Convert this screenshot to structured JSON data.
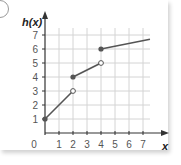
{
  "chart_data": {
    "type": "line",
    "title": "",
    "ylabel": "h(x)",
    "xlabel": "x",
    "origin_label": "0",
    "x_ticks": [
      "1",
      "2",
      "3",
      "4",
      "5",
      "6",
      "7"
    ],
    "y_ticks": [
      "1",
      "2",
      "3",
      "4",
      "5",
      "6",
      "7"
    ],
    "xlim": [
      0,
      7.5
    ],
    "ylim": [
      0,
      7.5
    ],
    "grid": true,
    "series": [
      {
        "name": "segment-1",
        "start": [
          0,
          1
        ],
        "end": [
          2,
          3
        ],
        "start_closed": true,
        "end_closed": false
      },
      {
        "name": "segment-2",
        "start": [
          2,
          4
        ],
        "end": [
          4,
          5
        ],
        "start_closed": true,
        "end_closed": false
      },
      {
        "name": "segment-3",
        "start": [
          4,
          6
        ],
        "end": [
          7.5,
          6.7
        ],
        "start_closed": true,
        "end_closed": null
      }
    ],
    "colors": {
      "line": "#555555",
      "grid": "#d4d4d4",
      "axis": "#333333",
      "text": "#555555"
    }
  }
}
